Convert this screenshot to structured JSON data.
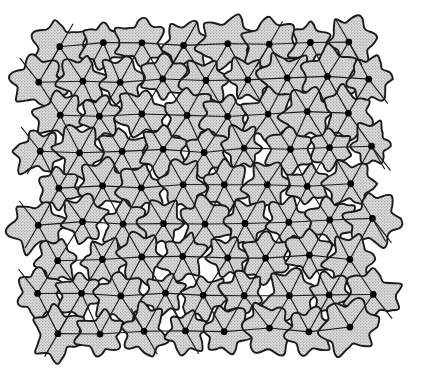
{
  "figure": {
    "type": "scientific-diagram",
    "background_color": "#ffffff",
    "width": 428,
    "height": 374
  },
  "style": {
    "line_color": "#1a1a1a",
    "blob_outline_color": "#1a1a1a",
    "blob_fill_color": "#d8d8d8",
    "stipple_dot_color": "#5a5a5a",
    "node_color": "#000000",
    "lattice_line_width": 1.15,
    "blob_outline_width": 1.9,
    "node_radius": 3.4,
    "blob_lobe_count": 6,
    "blob_radius_mean": 21,
    "blob_radius_jitter": 0.22
  },
  "lattice": {
    "description": "Triangular (hexagonal close-packed) lattice with alternating row offsets",
    "a_spacing": 41.5,
    "row_spacing": 36.2,
    "origin_x": 60,
    "origin_y": 45,
    "odd_row_offset": -20.75,
    "row_tilt_deg": -0.6,
    "position_jitter": 2.6,
    "rows": [
      {
        "index": 0,
        "y": 45,
        "x_start": 60,
        "count": 8
      },
      {
        "index": 1,
        "y": 81,
        "x_start": 39,
        "count": 9
      },
      {
        "index": 2,
        "y": 116,
        "x_start": 60,
        "count": 8
      },
      {
        "index": 3,
        "y": 152,
        "x_start": 39,
        "count": 9
      },
      {
        "index": 4,
        "y": 188,
        "x_start": 60,
        "count": 8
      },
      {
        "index": 5,
        "y": 224,
        "x_start": 39,
        "count": 9
      },
      {
        "index": 6,
        "y": 260,
        "x_start": 60,
        "count": 8
      },
      {
        "index": 7,
        "y": 296,
        "x_start": 39,
        "count": 9
      },
      {
        "index": 8,
        "y": 332,
        "x_start": 60,
        "count": 8
      }
    ],
    "bond_directions": [
      {
        "name": "horizontal",
        "angle_deg": 0
      },
      {
        "name": "diagonal-up-right",
        "angle_deg": -60
      },
      {
        "name": "diagonal-down-right",
        "angle_deg": 60
      }
    ],
    "overhang_length": 26,
    "overhang_nodes": [
      {
        "row": 0,
        "col": 0
      },
      {
        "row": 0,
        "col": 3
      },
      {
        "row": 0,
        "col": 5
      },
      {
        "row": 0,
        "col": 7
      },
      {
        "row": 3,
        "col": 0
      },
      {
        "row": 3,
        "col": 8
      },
      {
        "row": 5,
        "col": 0
      },
      {
        "row": 5,
        "col": 8
      },
      {
        "row": 8,
        "col": 0
      },
      {
        "row": 8,
        "col": 2
      },
      {
        "row": 8,
        "col": 3
      }
    ]
  },
  "chart_data": {
    "type": "scatter",
    "xlabel": "",
    "ylabel": "",
    "grid": false,
    "legend": null,
    "xlim": [
      0,
      428
    ],
    "ylim": [
      0,
      374
    ],
    "series": [
      {
        "name": "lattice nodes",
        "marker": "filled-circle",
        "color": "#000000",
        "row_counts": [
          8,
          9,
          8,
          9,
          8,
          9,
          8,
          9,
          8
        ],
        "row_y": [
          45,
          81,
          116,
          152,
          188,
          224,
          260,
          296,
          332
        ],
        "total_points": 76
      },
      {
        "name": "grain cells",
        "marker": "irregular-blob",
        "fill": "#d8d8d8",
        "outline": "#1a1a1a",
        "total_cells": 76
      }
    ]
  }
}
